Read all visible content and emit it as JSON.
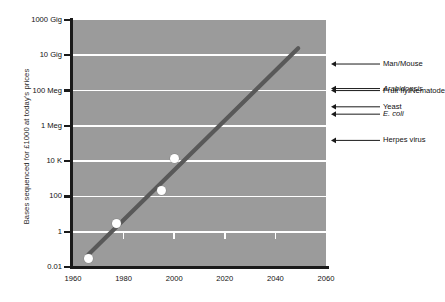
{
  "chart_data": {
    "type": "line",
    "title": "",
    "xlabel": "",
    "ylabel": "Bases sequenced for £1000 at today's prices",
    "xlim": [
      1960,
      2060
    ],
    "ylim": [
      0.01,
      1000000000000
    ],
    "grid": true,
    "legend_position": "none",
    "xticks": [
      "1960",
      "1980",
      "2000",
      "2020",
      "2040",
      "2060"
    ],
    "xtick_values": [
      1960,
      1980,
      2000,
      2020,
      2040,
      2060
    ],
    "yticks": [
      "0.01",
      "1",
      "100",
      "10 K",
      "1 Meg",
      "100 Meg",
      "10 Gig",
      "1000 Gig"
    ],
    "ytick_values": [
      0.01,
      1,
      100,
      10000,
      1000000,
      100000000,
      10000000000,
      1000000000000
    ],
    "yscale": "log",
    "series": [
      {
        "name": "Bases sequenced per £1000",
        "type": "scatter",
        "x": [
          1966,
          1977,
          1995,
          2000
        ],
        "y": [
          0.03,
          3,
          220,
          14000
        ],
        "x_labels": [
          "1966",
          "1977",
          "1995",
          "2000"
        ],
        "y_labels": [
          "0.03",
          "3",
          "220",
          "14 K"
        ]
      },
      {
        "name": "Trend line",
        "type": "line",
        "x": [
          1966,
          2049
        ],
        "y": [
          0.05,
          25000000000
        ],
        "color": "#595959"
      }
    ],
    "annotations": [
      {
        "label": "Man/Mouse",
        "value": 3200000000,
        "italic": false
      },
      {
        "label": "Arabidopsis",
        "value": 130000000,
        "italic": true
      },
      {
        "label": "Fruit fly/Nematode",
        "value": 100000000,
        "italic": false
      },
      {
        "label": "Yeast",
        "value": 12000000,
        "italic": false
      },
      {
        "label": "E. coli",
        "value": 4600000,
        "italic": true
      },
      {
        "label": "Herpes virus",
        "value": 150000,
        "italic": false
      }
    ],
    "colors": {
      "plot_background": "#9b9b9b",
      "gridline": "#ffffff",
      "trend_line": "#595959",
      "data_point": "#ffffff",
      "axis": "#1a1a1a",
      "text": "#111111",
      "page_background": "#ffffff"
    }
  }
}
